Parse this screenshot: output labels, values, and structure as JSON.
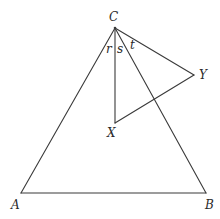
{
  "diagram": {
    "type": "geometry",
    "colors": {
      "line": "#3a3a3a",
      "text": "#2a2a2a",
      "background": "#ffffff"
    },
    "points": {
      "C": {
        "label": "C",
        "x": 115,
        "y": 28,
        "lx": 109,
        "ly": 21
      },
      "A": {
        "label": "A",
        "x": 21,
        "y": 193,
        "lx": 11,
        "ly": 209
      },
      "B": {
        "label": "B",
        "x": 206,
        "y": 193,
        "lx": 205,
        "ly": 209
      },
      "X": {
        "label": "X",
        "x": 115,
        "y": 123,
        "lx": 107,
        "ly": 137
      },
      "Y": {
        "label": "Y",
        "x": 194,
        "y": 75,
        "lx": 199,
        "ly": 79
      }
    },
    "segments": [
      {
        "from": "A",
        "to": "B"
      },
      {
        "from": "A",
        "to": "C"
      },
      {
        "from": "C",
        "to": "B"
      },
      {
        "from": "C",
        "to": "X"
      },
      {
        "from": "C",
        "to": "Y"
      },
      {
        "from": "X",
        "to": "Y"
      }
    ],
    "angle_labels": [
      {
        "label": "r",
        "x": 106,
        "y": 53
      },
      {
        "label": "s",
        "x": 117,
        "y": 53
      },
      {
        "label": "t",
        "x": 130,
        "y": 49
      }
    ]
  }
}
